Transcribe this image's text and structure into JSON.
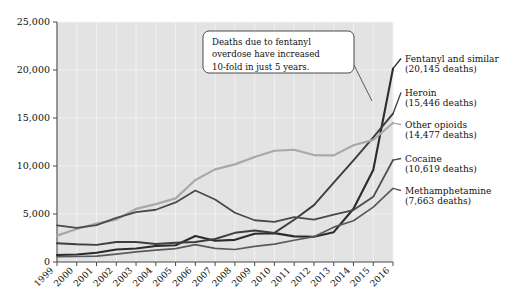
{
  "chart_data": {
    "type": "line",
    "title": "",
    "xlabel": "",
    "ylabel": "",
    "x": [
      1999,
      2000,
      2001,
      2002,
      2003,
      2004,
      2005,
      2006,
      2007,
      2008,
      2009,
      2010,
      2011,
      2012,
      2013,
      2014,
      2015,
      2016
    ],
    "categories": [
      "1999",
      "2000",
      "2001",
      "2002",
      "2003",
      "2004",
      "2005",
      "2006",
      "2007",
      "2008",
      "2009",
      "2010",
      "2011",
      "2012",
      "2013",
      "2014",
      "2015",
      "2016"
    ],
    "ylim": [
      0,
      25000
    ],
    "yticks": [
      0,
      5000,
      10000,
      15000,
      20000,
      25000
    ],
    "ytick_labels": [
      "0",
      "5,000",
      "10,000",
      "15,000",
      "20,000",
      "25,000"
    ],
    "grid": true,
    "legend_position": "right-inline-labels",
    "series": [
      {
        "name": "Fentanyl and similar",
        "label": "Fentanyl and similar",
        "value_label": "(20,145 deaths)",
        "final_value": 20145,
        "color": "#2b2b2b",
        "width": 2.1,
        "values": [
          730,
          782,
          957,
          1295,
          1400,
          1664,
          1742,
          2707,
          2213,
          2306,
          2946,
          3007,
          2666,
          2628,
          3105,
          5544,
          9580,
          20145
        ]
      },
      {
        "name": "Heroin",
        "label": "Heroin",
        "value_label": "(15,446 deaths)",
        "final_value": 15446,
        "color": "#3d3d3d",
        "width": 1.9,
        "values": [
          1960,
          1842,
          1779,
          2089,
          2080,
          1878,
          2009,
          2088,
          2399,
          3041,
          3278,
          3036,
          4397,
          5925,
          8257,
          10574,
          12989,
          15446
        ]
      },
      {
        "name": "Other opioids",
        "label": "Other opioids",
        "value_label": "(14,477 deaths)",
        "final_value": 14477,
        "color": "#a8a8a8",
        "width": 2.2,
        "values": [
          2749,
          3442,
          3994,
          4416,
          5528,
          6024,
          6632,
          8545,
          9647,
          10171,
          10943,
          11590,
          11693,
          11140,
          11107,
          12159,
          12727,
          14477
        ]
      },
      {
        "name": "Cocaine",
        "label": "Cocaine",
        "value_label": "(10,619 deaths)",
        "final_value": 10619,
        "color": "#4a4a4a",
        "width": 1.8,
        "values": [
          3822,
          3544,
          3833,
          4599,
          5196,
          5443,
          6208,
          7448,
          6512,
          5129,
          4350,
          4183,
          4681,
          4404,
          4944,
          5415,
          6784,
          10619
        ]
      },
      {
        "name": "Methamphetamine",
        "label": "Methamphetamine",
        "value_label": "(7,663 deaths)",
        "final_value": 7663,
        "color": "#5a5a5a",
        "width": 1.7,
        "values": [
          547,
          575,
          602,
          817,
          1058,
          1232,
          1398,
          1812,
          1414,
          1304,
          1633,
          1854,
          2266,
          2635,
          3627,
          4298,
          5716,
          7663
        ]
      }
    ],
    "annotations": [
      {
        "name": "fentanyl-callout",
        "lines": [
          "Deaths due to fentanyl",
          "overdose have increased",
          "10-fold in just 5 years."
        ]
      }
    ]
  },
  "colors": {
    "plot_background": "#e3e3e3",
    "page_background": "#ffffff",
    "gridline": "#f2f2f2",
    "axis": "#4a4a4a",
    "text": "#111111"
  }
}
